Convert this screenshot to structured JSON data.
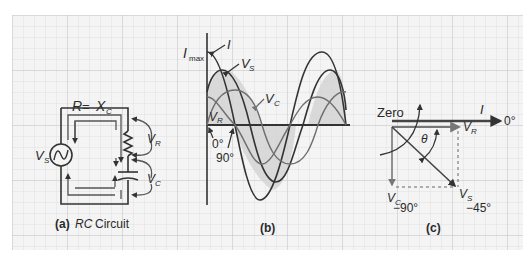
{
  "figure": {
    "background": "#ffffff",
    "grid": {
      "fill": "#f2f2f2",
      "minor_color": "#dcdcdc",
      "major_color": "#c4c4c4",
      "spacing_px": 11
    },
    "colors": {
      "ink": "#333333",
      "shade": "#d6d6d6",
      "phasor_gray": "#777777"
    }
  },
  "panel_a": {
    "caption_letter": "(a)",
    "caption_italic": "RC",
    "caption_text": " Circuit",
    "equation_R": "R",
    "equation_eq": " = ",
    "equation_X": "X",
    "equation_X_sub": "C",
    "source_label": "V",
    "source_sub": "S",
    "vr_label": "V",
    "vr_sub": "R",
    "vc_label": "V",
    "vc_sub": "C",
    "components": [
      "ac-source",
      "resistor",
      "capacitor"
    ]
  },
  "panel_b": {
    "caption": "(b)",
    "imax_label": "I",
    "imax_sub": "max",
    "i_label": "I",
    "vs_label": "V",
    "vs_sub": "S",
    "vc_label": "V",
    "vc_sub": "C",
    "vr_label": "V",
    "vr_sub": "R",
    "angle_0": "0°",
    "angle_90": "90°"
  },
  "panel_c": {
    "caption": "(c)",
    "zero_label": "Zero",
    "i_label": "I",
    "i_angle": "0°",
    "vr_label": "V",
    "vr_sub": "R",
    "theta_label": "θ",
    "vc_label": "V",
    "vc_sub": "C",
    "vc_angle": "−90°",
    "vs_label": "V",
    "vs_sub": "S",
    "vs_angle": "−45°"
  }
}
